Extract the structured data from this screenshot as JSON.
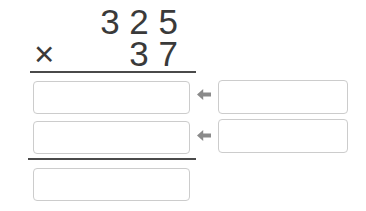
{
  "problem": {
    "multiplicand": "3 2 5",
    "operator": "×",
    "multiplier": "3 7"
  },
  "work_rows": [
    {
      "partial_input_value": "",
      "helper_input_value": "",
      "arrow_icon": "left-arrow"
    },
    {
      "partial_input_value": "",
      "helper_input_value": "",
      "arrow_icon": "left-arrow"
    }
  ],
  "answer": {
    "final_input_value": ""
  },
  "colors": {
    "text": "#3a3a3a",
    "rule_line": "#4a4a4a",
    "input_border": "#cccccc",
    "arrow": "#8a8a8a",
    "background": "#ffffff"
  }
}
